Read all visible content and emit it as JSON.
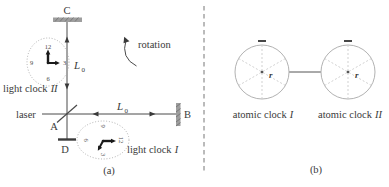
{
  "panel_a": {
    "caption": "(a)",
    "laser_label": "laser",
    "rotation_label": "rotation",
    "point_a": "A",
    "point_b": "B",
    "point_c": "C",
    "point_d": "D",
    "arm_length_symbol": "L",
    "arm_length_subscript": "0",
    "light_clock_1": {
      "label_prefix": "light clock",
      "numeral": "I",
      "numbers": {
        "twelve": "12",
        "three": "3",
        "six": "6",
        "nine": "9"
      }
    },
    "light_clock_2": {
      "label_prefix": "light clock",
      "numeral": "II",
      "numbers": {
        "twelve": "12",
        "three": "3",
        "six": "6",
        "nine": "9"
      }
    }
  },
  "panel_b": {
    "caption": "(b)",
    "atomic_clock_1": {
      "label_prefix": "atomic clock",
      "numeral": "I",
      "radius_label": "r"
    },
    "atomic_clock_2": {
      "label_prefix": "atomic clock",
      "numeral": "II",
      "radius_label": "r"
    }
  },
  "colors": {
    "line": "#4a4a4a",
    "text": "#3a3a3a",
    "mirror_fill": "#9e9e9e",
    "mirror_hatch": "#6e6e6e",
    "clock_outline": "#a8a8a8",
    "spoke": "#cccccc",
    "separator": "#777777"
  }
}
